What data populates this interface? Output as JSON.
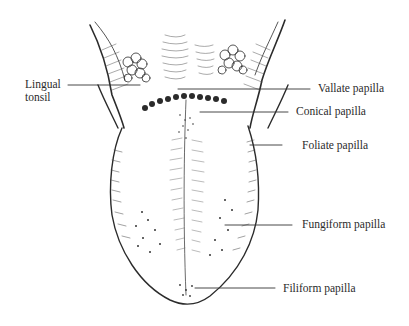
{
  "figure": {
    "labels": {
      "lingual_tonsil_line1": "Lingual",
      "lingual_tonsil_line2": "tonsil",
      "vallate": "Vallate papilla",
      "conical": "Conical papilla",
      "foliate": "Foliate papilla",
      "fungiform": "Fungiform papilla",
      "filiform": "Filiform papilla"
    },
    "colors": {
      "ink": "#2b2b2b",
      "background": "#ffffff"
    }
  }
}
